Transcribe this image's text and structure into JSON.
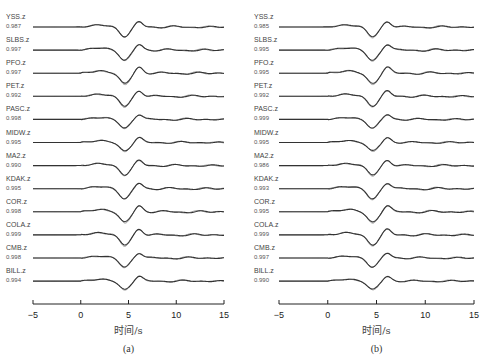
{
  "chart_data": [
    {
      "type": "line",
      "panel": "(a)",
      "title": "",
      "xlabel": "时间/s",
      "ylabel": "",
      "xlim": [
        -5,
        15
      ],
      "xticks": [
        -5,
        0,
        5,
        10,
        15
      ],
      "grid": false,
      "legend": null,
      "description": "Observed (dark) vs synthetic (gray) vertical-component waveforms, stacked by station, with correlation coefficients",
      "traces": [
        {
          "station": "YSS.z",
          "cc": "0.987"
        },
        {
          "station": "SLBS.z",
          "cc": "0.997"
        },
        {
          "station": "PFO.z",
          "cc": "0.997"
        },
        {
          "station": "PET.z",
          "cc": "0.992"
        },
        {
          "station": "PASC.z",
          "cc": "0.998"
        },
        {
          "station": "MIDW.z",
          "cc": "0.995"
        },
        {
          "station": "MA2.z",
          "cc": "0.990"
        },
        {
          "station": "KDAK.z",
          "cc": "0.995"
        },
        {
          "station": "COR.z",
          "cc": "0.998"
        },
        {
          "station": "COLA.z",
          "cc": "0.999"
        },
        {
          "station": "CMB.z",
          "cc": "0.998"
        },
        {
          "station": "BILL.z",
          "cc": "0.994"
        }
      ],
      "waveform_features": {
        "trough_time_s": 4.5,
        "peak_time_s": 6.0
      }
    },
    {
      "type": "line",
      "panel": "(b)",
      "title": "",
      "xlabel": "时间/s",
      "ylabel": "",
      "xlim": [
        -5,
        15
      ],
      "xticks": [
        -5,
        0,
        5,
        10,
        15
      ],
      "grid": false,
      "legend": null,
      "description": "Observed (dark) vs synthetic (gray) vertical-component waveforms, stacked by station, with correlation coefficients",
      "traces": [
        {
          "station": "YSS.z",
          "cc": "0.985"
        },
        {
          "station": "SLBS.z",
          "cc": "0.995"
        },
        {
          "station": "PFO.z",
          "cc": "0.995"
        },
        {
          "station": "PET.z",
          "cc": "0.992"
        },
        {
          "station": "PASC.z",
          "cc": "0.999"
        },
        {
          "station": "MIDW.z",
          "cc": "0.995"
        },
        {
          "station": "MA2.z",
          "cc": "0.986"
        },
        {
          "station": "KDAK.z",
          "cc": "0.993"
        },
        {
          "station": "COR.z",
          "cc": "0.995"
        },
        {
          "station": "COLA.z",
          "cc": "0.999"
        },
        {
          "station": "CMB.z",
          "cc": "0.997"
        },
        {
          "station": "BILL.z",
          "cc": "0.990"
        }
      ],
      "waveform_features": {
        "trough_time_s": 4.5,
        "peak_time_s": 6.0
      }
    }
  ],
  "colors": {
    "observed": "#333333",
    "synthetic": "#9a9a9a",
    "axis": "#222222"
  }
}
